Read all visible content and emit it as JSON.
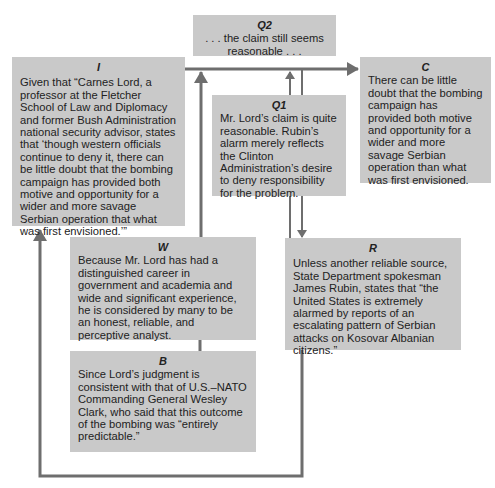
{
  "diagram": {
    "type": "Toulmin argument model",
    "colors": {
      "box_fill": "#c9c9c9",
      "line": "#6e6e6e",
      "background": "#ffffff"
    },
    "nodes": {
      "I": {
        "label": "I",
        "text": "Given that “Carnes Lord, a professor at the Fletcher School of Law and Diplomacy and former Bush Administration national security advisor, states that ‘though western officials continue to deny it, there can be little doubt that the bombing campaign has provided both motive and opportunity for a wider and more savage Serbian operation that what was first envisioned.’”"
      },
      "Q2": {
        "label": "Q2",
        "text": ". . . the claim still seems reasonable . . ."
      },
      "C": {
        "label": "C",
        "text": "There can be little doubt that the bombing campaign has provided both motive and opportunity for a wider and more savage Serbian operation than what was first envisioned."
      },
      "Q1": {
        "label": "Q1",
        "text": "Mr. Lord’s claim is quite reasonable. Rubin’s alarm merely reflects the Clinton Administration’s desire to deny responsibility for the problem."
      },
      "W": {
        "label": "W",
        "text": "Because Mr. Lord has had a distinguished career in government and academia and wide and significant experience, he is considered by many to be an honest, reliable, and perceptive analyst."
      },
      "B": {
        "label": "B",
        "text": "Since Lord’s judgment is consistent with that of U.S.–NATO Commanding General Wesley Clark, who said that this outcome of the bombing was “entirely predictable.”"
      },
      "R": {
        "label": "R",
        "text": "Unless another reliable source, State Department spokesman James Rubin, states that “the United States is extremely alarmed by reports of an escalating pattern of Serbian attacks on Kosovar Albanian citizens.”"
      }
    },
    "edges": [
      {
        "from": "I",
        "to": "C",
        "kind": "arrow"
      },
      {
        "from": "W",
        "to": "main-line",
        "kind": "arrow"
      },
      {
        "from": "Q1",
        "to": "main-line",
        "kind": "arrow"
      },
      {
        "from": "main-line",
        "to": "R",
        "kind": "arrow"
      },
      {
        "from": "W",
        "to": "B",
        "kind": "line"
      },
      {
        "from": "R",
        "to": "I",
        "kind": "loop-arrow"
      }
    ]
  }
}
